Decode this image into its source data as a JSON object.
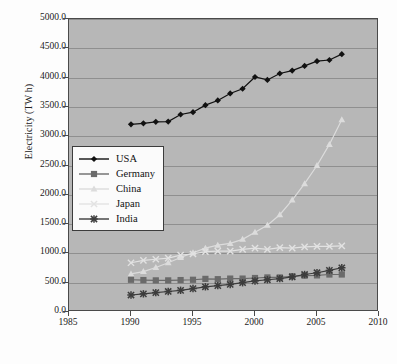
{
  "chart_data": {
    "type": "line",
    "title": "",
    "xlabel": "",
    "ylabel": "Electricity (TW h)",
    "xlim": [
      1985,
      2010
    ],
    "ylim": [
      0,
      5000
    ],
    "xticks": [
      "1985",
      "1990",
      "1995",
      "2000",
      "2005",
      "2010"
    ],
    "yticks": [
      "0.0",
      "500.0",
      "1000.0",
      "1500.0",
      "2000.0",
      "2500.0",
      "3000.0",
      "3500.0",
      "4000.0",
      "4500.0",
      "5000.0"
    ],
    "grid": true,
    "legend_position": "center-left-inside",
    "plot_background": "#b7b7b7",
    "x": [
      1990,
      1991,
      1992,
      1993,
      1994,
      1995,
      1996,
      1997,
      1998,
      1999,
      2000,
      2001,
      2002,
      2003,
      2004,
      2005,
      2006,
      2007
    ],
    "series": [
      {
        "name": "USA",
        "color": "#111111",
        "marker": "diamond",
        "values": [
          3203,
          3220,
          3245,
          3250,
          3370,
          3410,
          3530,
          3610,
          3730,
          3810,
          4010,
          3960,
          4070,
          4120,
          4200,
          4280,
          4300,
          4400
        ]
      },
      {
        "name": "Germany",
        "color": "#6a6a6a",
        "marker": "square",
        "values": [
          550,
          545,
          540,
          540,
          545,
          550,
          565,
          560,
          570,
          570,
          580,
          590,
          590,
          610,
          620,
          625,
          640,
          640
        ]
      },
      {
        "name": "China",
        "color": "#dcdcdc",
        "marker": "triangle",
        "values": [
          650,
          690,
          760,
          840,
          930,
          1010,
          1090,
          1140,
          1170,
          1240,
          1360,
          1480,
          1660,
          1910,
          2190,
          2500,
          2860,
          3280
        ]
      },
      {
        "name": "Japan",
        "color": "#e2e2e2",
        "marker": "cross",
        "values": [
          840,
          880,
          900,
          920,
          970,
          990,
          1030,
          1040,
          1040,
          1070,
          1090,
          1070,
          1100,
          1090,
          1110,
          1120,
          1120,
          1130
        ]
      },
      {
        "name": "India",
        "color": "#3c3c3c",
        "marker": "asterisk",
        "values": [
          290,
          310,
          330,
          350,
          370,
          400,
          430,
          450,
          470,
          500,
          530,
          550,
          570,
          600,
          640,
          670,
          710,
          755
        ]
      }
    ]
  },
  "legend": {
    "items": [
      {
        "label": "USA"
      },
      {
        "label": "Germany"
      },
      {
        "label": "China"
      },
      {
        "label": "Japan"
      },
      {
        "label": "India"
      }
    ]
  }
}
